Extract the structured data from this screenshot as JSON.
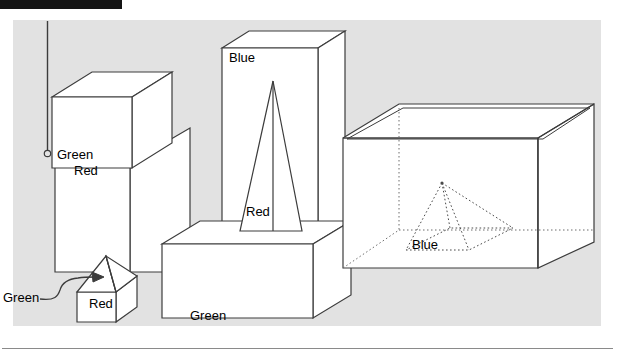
{
  "page": {
    "background_color": "#ffffff",
    "panel_color": "#e2e2e2",
    "stroke_color": "#3c3c3c",
    "face_color": "#ffffff",
    "label_color": "#000000",
    "header_bar_color": "#151515",
    "rule_color": "#8a8a8a"
  },
  "figure": {
    "title": "",
    "panel": {
      "x": 13,
      "y": 20,
      "width": 588,
      "height": 306
    },
    "header_bar": {
      "x": 0,
      "y": 0,
      "width": 122,
      "height": 9
    },
    "bottom_rule": {
      "x1": 2,
      "y1": 348,
      "x2": 613,
      "y2": 348
    },
    "plumb_line": {
      "x": 47,
      "y_top": 22,
      "y_bottom": 153,
      "marker": "circle-endpoint"
    },
    "objects": [
      {
        "id": "green-cube-top-left",
        "label": "Green",
        "shape": "cube",
        "style": "solid"
      },
      {
        "id": "red-tall-box-left",
        "label": "Red",
        "shape": "box",
        "style": "solid"
      },
      {
        "id": "blue-tall-box",
        "label": "Blue",
        "shape": "box",
        "style": "solid"
      },
      {
        "id": "red-tall-pyramid",
        "label": "Red",
        "shape": "pyramid",
        "style": "solid"
      },
      {
        "id": "green-long-box",
        "label": "Green",
        "shape": "box",
        "style": "solid"
      },
      {
        "id": "red-small-cube",
        "label": "Red",
        "shape": "cube",
        "style": "solid"
      },
      {
        "id": "green-small-pyramid",
        "label": "Green",
        "shape": "pyramid",
        "style": "solid"
      },
      {
        "id": "open-container-box",
        "label": "",
        "shape": "open-box",
        "style": "solid"
      },
      {
        "id": "blue-hidden-pyramid",
        "label": "Blue",
        "shape": "pyramid",
        "style": "dotted"
      }
    ],
    "labels": [
      {
        "id": "label-green-cube",
        "text": "Green",
        "x": 57,
        "y": 159
      },
      {
        "id": "label-red-tall-box",
        "text": "Red",
        "x": 74,
        "y": 175
      },
      {
        "id": "label-blue-tall-box",
        "text": "Blue",
        "x": 229,
        "y": 62
      },
      {
        "id": "label-red-tall-pyramid",
        "text": "Red",
        "x": 246,
        "y": 216
      },
      {
        "id": "label-green-long-box",
        "text": "Green",
        "x": 190,
        "y": 320
      },
      {
        "id": "label-red-small-cube",
        "text": "Red",
        "x": 89,
        "y": 308
      },
      {
        "id": "label-green-small-pyr",
        "text": "Green",
        "x": 3,
        "y": 302
      },
      {
        "id": "label-blue-hidden-pyr",
        "text": "Blue",
        "x": 412,
        "y": 249
      }
    ]
  }
}
